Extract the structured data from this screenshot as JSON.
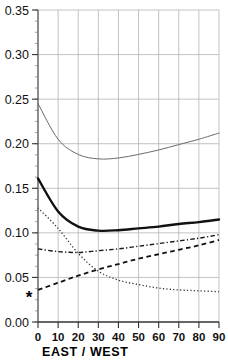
{
  "chart_data": {
    "type": "line",
    "title": "",
    "subtitle": "",
    "xlabel": "EAST / WEST",
    "ylabel": "",
    "xlim": [
      0,
      90
    ],
    "ylim": [
      0.0,
      0.35
    ],
    "xticks": [
      0,
      10,
      20,
      30,
      40,
      50,
      60,
      70,
      80,
      90
    ],
    "xtick_labels": [
      "0",
      "10",
      "20",
      "30",
      "40",
      "50",
      "60",
      "70",
      "80",
      "90"
    ],
    "yticks": [
      0.0,
      0.05,
      0.1,
      0.15,
      0.2,
      0.25,
      0.3,
      0.35
    ],
    "ytick_labels": [
      "0.00",
      "0.05",
      "0.10",
      "0.15",
      "0.20",
      "0.25",
      "0.30",
      "0.35"
    ],
    "ytick_minor_step": 0.0125,
    "grid": true,
    "grid_color": "#b4b4b4",
    "legend": "none",
    "x": [
      0,
      10,
      20,
      30,
      40,
      50,
      60,
      70,
      80,
      90
    ],
    "series": [
      {
        "name": "thin-solid",
        "style": "solid",
        "width": 1.0,
        "color": "#6b6b6b",
        "values": [
          0.245,
          0.205,
          0.188,
          0.183,
          0.184,
          0.188,
          0.193,
          0.199,
          0.205,
          0.212
        ]
      },
      {
        "name": "bold-solid",
        "style": "solid",
        "width": 2.4,
        "color": "#111111",
        "values": [
          0.161,
          0.124,
          0.107,
          0.1025,
          0.103,
          0.105,
          0.107,
          0.11,
          0.112,
          0.115
        ]
      },
      {
        "name": "dotted",
        "style": "dotted",
        "width": 1.3,
        "color": "#333333",
        "values": [
          0.128,
          0.105,
          0.077,
          0.057,
          0.047,
          0.042,
          0.038,
          0.036,
          0.035,
          0.034
        ]
      },
      {
        "name": "dash-dot",
        "style": "dashdot",
        "width": 1.4,
        "color": "#1a1a1a",
        "values": [
          0.082,
          0.079,
          0.078,
          0.08,
          0.082,
          0.085,
          0.088,
          0.091,
          0.094,
          0.098
        ]
      },
      {
        "name": "dashed",
        "style": "dashed",
        "width": 1.8,
        "color": "#111111",
        "values": [
          0.036,
          0.044,
          0.052,
          0.059,
          0.065,
          0.071,
          0.076,
          0.081,
          0.086,
          0.092
        ]
      }
    ],
    "annotations": [
      {
        "name": "star-marker",
        "symbol": "*",
        "x": -4.5,
        "y": 0.028
      }
    ]
  }
}
